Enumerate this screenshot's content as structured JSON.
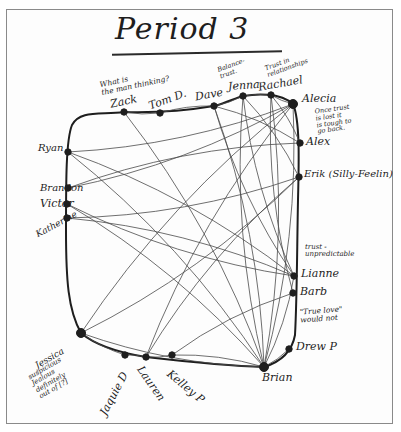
{
  "title": "Period 3",
  "colors": {
    "ink": "#1e1e1e",
    "edge": "#4a4a4a",
    "border": "#8a8a8a",
    "paper": "#fdfdfd"
  },
  "nodes": [
    {
      "id": "zack",
      "label": "Zack",
      "x": 124,
      "y": 112
    },
    {
      "id": "tom",
      "label": "Tom D.",
      "x": 160,
      "y": 113
    },
    {
      "id": "dave",
      "label": "Dave",
      "x": 214,
      "y": 106
    },
    {
      "id": "jenna",
      "label": "Jenna",
      "x": 243,
      "y": 96
    },
    {
      "id": "rachael",
      "label": "Rachael",
      "x": 271,
      "y": 95
    },
    {
      "id": "alecia",
      "label": "Alecia",
      "x": 293,
      "y": 104
    },
    {
      "id": "alex",
      "label": "Alex",
      "x": 300,
      "y": 143
    },
    {
      "id": "erik",
      "label": "Erik (Silly-Feelin)",
      "x": 299,
      "y": 177
    },
    {
      "id": "liane",
      "label": "Lianne",
      "x": 294,
      "y": 276
    },
    {
      "id": "barb",
      "label": "Barb",
      "x": 293,
      "y": 293
    },
    {
      "id": "drew",
      "label": "Drew P",
      "x": 289,
      "y": 349
    },
    {
      "id": "brian",
      "label": "Brian",
      "x": 264,
      "y": 367
    },
    {
      "id": "kelley",
      "label": "Kelley P",
      "x": 172,
      "y": 355
    },
    {
      "id": "lauren",
      "label": "Lauren",
      "x": 146,
      "y": 357
    },
    {
      "id": "jaquie",
      "label": "Jaquie D",
      "x": 125,
      "y": 355
    },
    {
      "id": "jessica",
      "label": "Jessica",
      "x": 81,
      "y": 333
    },
    {
      "id": "katherine",
      "label": "Katherine",
      "x": 67,
      "y": 218
    },
    {
      "id": "victor",
      "label": "Victor",
      "x": 67,
      "y": 204
    },
    {
      "id": "brandon",
      "label": "Brandon",
      "x": 68,
      "y": 188
    },
    {
      "id": "ryan",
      "label": "Ryan",
      "x": 68,
      "y": 152
    }
  ],
  "annotations": [
    {
      "id": "note-zack",
      "text": "What is\nthe man thinking?"
    },
    {
      "id": "note-dave",
      "text": "Balance-\ntrust."
    },
    {
      "id": "note-rachael",
      "text": "Trust in\nrelationships"
    },
    {
      "id": "note-alecia",
      "text": "Once trust\nis lost it\nis tough to\ngo back."
    },
    {
      "id": "note-liane",
      "text": "trust -\nunpredictable"
    },
    {
      "id": "note-barb",
      "text": "\"True love\"\nwould not"
    },
    {
      "id": "note-jessica",
      "text": "suspicious\nJealous\ndefinitely\nout of [?]"
    }
  ],
  "edges": [
    [
      "ryan",
      "liane"
    ],
    [
      "ryan",
      "alecia"
    ],
    [
      "ryan",
      "brian"
    ],
    [
      "brandon",
      "alecia"
    ],
    [
      "brandon",
      "alex"
    ],
    [
      "victor",
      "liane"
    ],
    [
      "victor",
      "brian"
    ],
    [
      "katherine",
      "erik"
    ],
    [
      "zack",
      "brian"
    ],
    [
      "zack",
      "tom"
    ],
    [
      "tom",
      "dave"
    ],
    [
      "dave",
      "jenna"
    ],
    [
      "jenna",
      "rachael"
    ],
    [
      "rachael",
      "alecia"
    ],
    [
      "dave",
      "brian"
    ],
    [
      "dave",
      "liane"
    ],
    [
      "dave",
      "alex"
    ],
    [
      "jenna",
      "brian"
    ],
    [
      "jenna",
      "erik"
    ],
    [
      "jenna",
      "liane"
    ],
    [
      "rachael",
      "brian"
    ],
    [
      "rachael",
      "barb"
    ],
    [
      "rachael",
      "alex"
    ],
    [
      "alecia",
      "jessica"
    ],
    [
      "alecia",
      "brian"
    ],
    [
      "alecia",
      "lauren"
    ],
    [
      "erik",
      "jessica"
    ],
    [
      "erik",
      "lauren"
    ],
    [
      "liane",
      "brian"
    ],
    [
      "barb",
      "kelley"
    ],
    [
      "drew",
      "brian"
    ],
    [
      "jessica",
      "jaquie"
    ],
    [
      "jaquie",
      "lauren"
    ],
    [
      "lauren",
      "kelley"
    ],
    [
      "kelley",
      "brian"
    ],
    [
      "jessica",
      "brian"
    ],
    [
      "katherine",
      "liane"
    ]
  ]
}
